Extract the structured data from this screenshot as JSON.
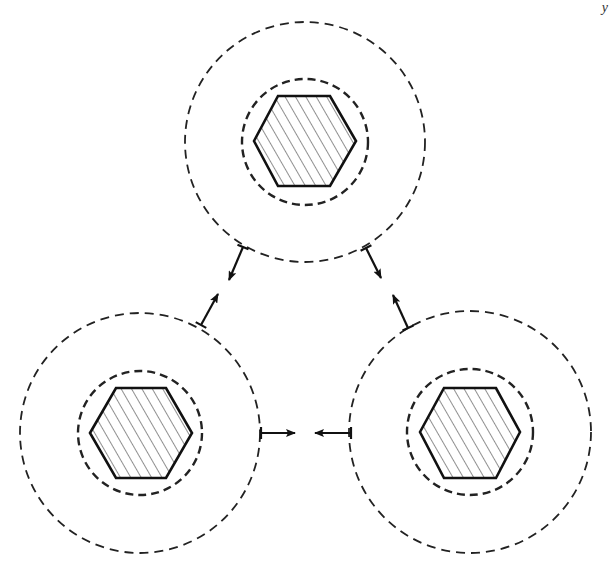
{
  "diagram": {
    "title": "",
    "corner_mark": "y",
    "colors": {
      "stroke": "#111111",
      "background": "#ffffff",
      "hatch": "#333333"
    },
    "units": [
      {
        "id": "top",
        "center": [
          305,
          142
        ],
        "outer_radius": 120,
        "inner_radius": 63,
        "hexagon": [
          [
            254,
            141
          ],
          [
            278,
            96
          ],
          [
            330,
            96
          ],
          [
            356,
            141
          ],
          [
            330,
            186
          ],
          [
            278,
            186
          ]
        ]
      },
      {
        "id": "bottom-left",
        "center": [
          140,
          433
        ],
        "outer_radius": 120,
        "inner_radius": 62,
        "hexagon": [
          [
            90,
            433
          ],
          [
            116,
            388
          ],
          [
            166,
            388
          ],
          [
            192,
            433
          ],
          [
            166,
            478
          ],
          [
            116,
            478
          ]
        ]
      },
      {
        "id": "bottom-right",
        "center": [
          470,
          432
        ],
        "outer_radius": 121,
        "inner_radius": 63,
        "hexagon": [
          [
            420,
            432
          ],
          [
            444,
            388
          ],
          [
            496,
            388
          ],
          [
            520,
            432
          ],
          [
            496,
            478
          ],
          [
            444,
            478
          ]
        ]
      }
    ],
    "arrows": [
      {
        "id": "top-to-left",
        "from": [
          243,
          247
        ],
        "to": [
          229,
          280
        ]
      },
      {
        "id": "left-to-top",
        "from": [
          201,
          325
        ],
        "to": [
          218,
          294
        ]
      },
      {
        "id": "top-to-right",
        "from": [
          366,
          248
        ],
        "to": [
          381,
          278
        ]
      },
      {
        "id": "right-to-top",
        "from": [
          408,
          328
        ],
        "to": [
          393,
          295
        ]
      },
      {
        "id": "left-to-right",
        "from": [
          261,
          433
        ],
        "to": [
          295,
          433
        ]
      },
      {
        "id": "right-to-left",
        "from": [
          351,
          433
        ],
        "to": [
          315,
          433
        ]
      }
    ]
  }
}
